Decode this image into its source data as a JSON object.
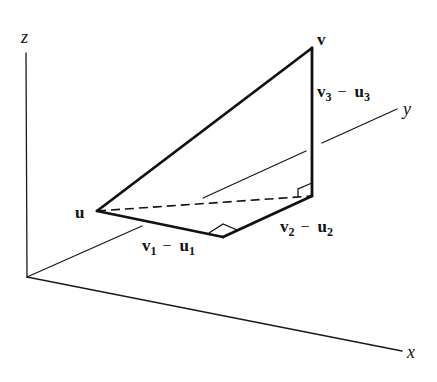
{
  "figure": {
    "axes": {
      "x_label": "x",
      "y_label": "y",
      "z_label": "z"
    },
    "points": {
      "u_label": "u",
      "v_label": "v"
    },
    "components": {
      "c1": {
        "a": "v",
        "a_sub": "1",
        "op": "−",
        "b": "u",
        "b_sub": "1"
      },
      "c2": {
        "a": "v",
        "a_sub": "2",
        "op": "−",
        "b": "u",
        "b_sub": "2"
      },
      "c3": {
        "a": "v",
        "a_sub": "3",
        "op": "−",
        "b": "u",
        "b_sub": "3"
      }
    },
    "colors": {
      "ink": "#111111",
      "background": "#ffffff"
    }
  }
}
